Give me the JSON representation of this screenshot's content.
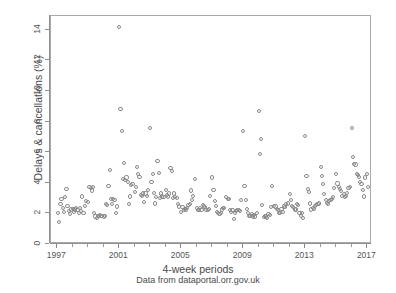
{
  "chart_data": {
    "type": "scatter",
    "title": "",
    "xlabel": "4-week periods",
    "ylabel": "Delays & cancellations (%)",
    "caption": "Data from dataportal.orr.gov.uk",
    "marker": "open-circle",
    "marker_color": "#8a8a8a",
    "grid": false,
    "legend": false,
    "xlim": [
      1996.6,
      2017.3
    ],
    "ylim": [
      0,
      14.9
    ],
    "xticks_major": [
      1997,
      2001,
      2005,
      2009,
      2013,
      2017
    ],
    "xticklabels": [
      "1997",
      "2001",
      "2005",
      "2009",
      "2013",
      "2017"
    ],
    "xticks_minor": [
      1998,
      1999,
      2000,
      2002,
      2003,
      2004,
      2006,
      2007,
      2008,
      2010,
      2011,
      2012,
      2014,
      2015,
      2016
    ],
    "yticks": [
      0,
      2,
      4,
      6,
      8,
      10,
      12,
      14
    ],
    "yticklabels": [
      "0",
      "2",
      "4",
      "6",
      "8",
      "10",
      "12",
      "14"
    ],
    "n_points": 262,
    "x": [
      1997.05,
      1997.13,
      1997.21,
      1997.28,
      1997.36,
      1997.44,
      1997.52,
      1997.6,
      1997.67,
      1997.75,
      1997.83,
      1997.91,
      1998.0,
      1998.08,
      1998.16,
      1998.23,
      1998.31,
      1998.39,
      1998.47,
      1998.55,
      1998.62,
      1998.7,
      1998.78,
      1998.86,
      1999.0,
      1999.08,
      1999.16,
      1999.23,
      1999.31,
      1999.39,
      1999.47,
      1999.55,
      1999.62,
      1999.7,
      1999.78,
      1999.86,
      2000.0,
      2000.08,
      2000.16,
      2000.23,
      2000.31,
      2000.39,
      2000.47,
      2000.55,
      2000.62,
      2000.7,
      2000.78,
      2000.86,
      2001.0,
      2001.08,
      2001.16,
      2001.23,
      2001.31,
      2001.39,
      2001.47,
      2001.55,
      2001.62,
      2001.7,
      2001.78,
      2001.86,
      2002.0,
      2002.08,
      2002.16,
      2002.23,
      2002.31,
      2002.39,
      2002.47,
      2002.55,
      2002.62,
      2002.7,
      2002.78,
      2002.86,
      2003.0,
      2003.08,
      2003.16,
      2003.23,
      2003.31,
      2003.39,
      2003.47,
      2003.55,
      2003.62,
      2003.7,
      2003.78,
      2003.86,
      2004.0,
      2004.08,
      2004.16,
      2004.23,
      2004.31,
      2004.39,
      2004.47,
      2004.55,
      2004.62,
      2004.7,
      2004.78,
      2004.86,
      2005.0,
      2005.08,
      2005.16,
      2005.23,
      2005.31,
      2005.39,
      2005.47,
      2005.55,
      2005.62,
      2005.7,
      2005.78,
      2005.86,
      2006.0,
      2006.08,
      2006.16,
      2006.23,
      2006.31,
      2006.39,
      2006.47,
      2006.55,
      2006.62,
      2006.7,
      2006.78,
      2006.86,
      2007.0,
      2007.08,
      2007.16,
      2007.23,
      2007.31,
      2007.39,
      2007.47,
      2007.55,
      2007.62,
      2007.7,
      2007.78,
      2007.86,
      2008.0,
      2008.08,
      2008.16,
      2008.23,
      2008.31,
      2008.39,
      2008.47,
      2008.55,
      2008.62,
      2008.7,
      2008.78,
      2008.86,
      2009.0,
      2009.08,
      2009.16,
      2009.23,
      2009.31,
      2009.39,
      2009.47,
      2009.55,
      2009.62,
      2009.7,
      2009.78,
      2009.86,
      2010.0,
      2010.08,
      2010.16,
      2010.23,
      2010.31,
      2010.39,
      2010.47,
      2010.55,
      2010.62,
      2010.7,
      2010.78,
      2010.86,
      2011.0,
      2011.08,
      2011.16,
      2011.23,
      2011.31,
      2011.39,
      2011.47,
      2011.55,
      2011.62,
      2011.7,
      2011.78,
      2011.86,
      2012.0,
      2012.08,
      2012.16,
      2012.23,
      2012.31,
      2012.39,
      2012.47,
      2012.55,
      2012.62,
      2012.7,
      2012.78,
      2012.86,
      2013.0,
      2013.08,
      2013.16,
      2013.23,
      2013.31,
      2013.39,
      2013.47,
      2013.55,
      2013.62,
      2013.7,
      2013.78,
      2013.86,
      2014.0,
      2014.08,
      2014.16,
      2014.23,
      2014.31,
      2014.39,
      2014.47,
      2014.55,
      2014.62,
      2014.7,
      2014.78,
      2014.86,
      2015.0,
      2015.08,
      2015.16,
      2015.23,
      2015.31,
      2015.39,
      2015.47,
      2015.55,
      2015.62,
      2015.7,
      2015.78,
      2015.86,
      2016.0,
      2016.08,
      2016.16,
      2016.23,
      2016.31,
      2016.39,
      2016.47,
      2016.55,
      2016.62,
      2016.7,
      2016.78,
      2016.86,
      2017.0,
      2017.05
    ],
    "y": [
      2.05,
      1.45,
      2.6,
      2.95,
      2.35,
      2.1,
      3.05,
      3.6,
      2.5,
      2.15,
      1.95,
      2.25,
      2.3,
      2.1,
      2.25,
      2.35,
      2.2,
      2.05,
      2.35,
      2.15,
      3.1,
      2.0,
      2.5,
      2.8,
      2.75,
      3.75,
      3.65,
      3.5,
      3.75,
      2.05,
      1.8,
      1.7,
      1.85,
      1.85,
      1.9,
      1.85,
      1.8,
      1.85,
      2.6,
      2.55,
      3.8,
      4.85,
      2.95,
      2.6,
      2.95,
      2.85,
      2.05,
      2.45,
      14.2,
      8.8,
      7.4,
      4.25,
      5.3,
      4.2,
      4.35,
      4.05,
      2.6,
      3.1,
      3.85,
      3.9,
      3.4,
      3.75,
      5.05,
      4.6,
      4.4,
      3.2,
      3.15,
      3.3,
      2.75,
      3.3,
      3.15,
      3.55,
      7.6,
      4.05,
      4.55,
      3.35,
      2.65,
      3.05,
      5.4,
      4.65,
      3.0,
      3.3,
      3.1,
      3.05,
      3.55,
      3.2,
      3.1,
      3.3,
      4.95,
      4.75,
      3.0,
      3.3,
      3.05,
      3.0,
      2.6,
      2.45,
      2.1,
      2.4,
      2.2,
      2.3,
      2.25,
      2.35,
      2.55,
      2.6,
      3.5,
      2.9,
      3.15,
      4.25,
      2.35,
      2.2,
      2.2,
      2.35,
      2.2,
      2.55,
      2.45,
      2.4,
      2.2,
      2.2,
      2.3,
      3.15,
      4.35,
      3.55,
      2.8,
      2.5,
      2.1,
      2.0,
      1.95,
      2.05,
      2.25,
      2.35,
      2.35,
      3.05,
      2.95,
      2.95,
      2.2,
      2.1,
      2.2,
      1.65,
      2.05,
      2.15,
      2.2,
      2.2,
      2.15,
      2.85,
      7.4,
      3.8,
      2.9,
      2.3,
      2.0,
      1.85,
      1.85,
      1.95,
      1.8,
      1.9,
      1.8,
      2.0,
      8.7,
      5.9,
      6.85,
      2.55,
      1.75,
      1.85,
      1.8,
      1.7,
      1.95,
      1.9,
      2.4,
      3.8,
      2.5,
      2.45,
      2.3,
      2.2,
      2.0,
      2.05,
      2.3,
      2.1,
      2.45,
      2.4,
      2.6,
      2.65,
      3.25,
      2.85,
      2.5,
      2.4,
      2.25,
      2.25,
      2.6,
      2.55,
      2.05,
      1.85,
      2.0,
      1.7,
      7.05,
      4.45,
      3.6,
      3.4,
      2.65,
      2.25,
      2.35,
      2.3,
      2.5,
      2.55,
      2.6,
      2.65,
      5.05,
      4.45,
      3.9,
      3.25,
      2.85,
      2.7,
      2.6,
      2.8,
      2.85,
      2.95,
      3.05,
      3.65,
      4.55,
      3.95,
      3.75,
      3.6,
      3.45,
      3.15,
      3.25,
      3.05,
      3.15,
      3.35,
      3.65,
      3.7,
      7.6,
      5.7,
      5.25,
      5.2,
      4.55,
      4.5,
      4.4,
      4.05,
      3.9,
      3.55,
      3.1,
      4.35,
      4.55,
      3.7
    ],
    "notable_outliers": [
      {
        "x": 2001.0,
        "y": 14.2
      },
      {
        "x": 2001.08,
        "y": 8.8
      },
      {
        "x": 2001.16,
        "y": 7.4
      },
      {
        "x": 2003.0,
        "y": 7.6
      },
      {
        "x": 2009.0,
        "y": 7.4
      },
      {
        "x": 2010.0,
        "y": 8.7
      },
      {
        "x": 2010.16,
        "y": 6.85
      },
      {
        "x": 2010.08,
        "y": 5.9
      },
      {
        "x": 2013.0,
        "y": 7.05
      },
      {
        "x": 2016.0,
        "y": 7.6
      },
      {
        "x": 2016.08,
        "y": 5.7
      }
    ]
  }
}
